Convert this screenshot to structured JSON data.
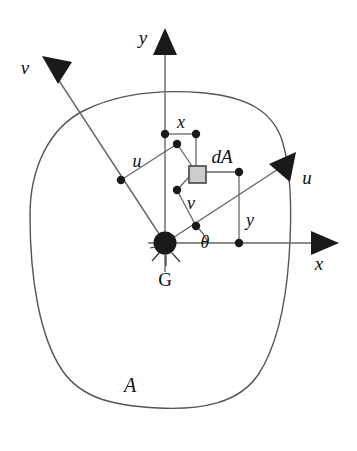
{
  "figure": {
    "background_color": "#ffffff",
    "outline_color": "#555555",
    "line_color": "#555555",
    "marker_color": "#111111",
    "element_fill_color": "#cccccc",
    "element_stroke_color": "#444444"
  },
  "labels": {
    "axis_y": "y",
    "axis_x": "x",
    "axis_u_right": "u",
    "axis_v_left": "v",
    "dim_x": "x",
    "dim_y": "y",
    "dim_u": "u",
    "dim_v": "v",
    "angle_theta": "θ",
    "element_dA": "dA",
    "area_A": "A",
    "centroid_G": "G"
  },
  "geometry": {
    "centroid": {
      "x": 165,
      "y": 243,
      "radius": 11
    },
    "axis_y": {
      "x": 165,
      "y_top": 44,
      "y_bottom": 270,
      "arrow_tip": [
        165,
        30
      ]
    },
    "axis_x": {
      "y": 243,
      "x_left": 150,
      "x_right": 322,
      "arrow_tip": [
        337,
        243
      ]
    },
    "axis_u": {
      "from": [
        165,
        243
      ],
      "to": [
        276,
        170
      ],
      "arrow_tip": [
        292,
        157
      ]
    },
    "axis_v": {
      "from": [
        165,
        243
      ],
      "to": [
        60,
        82
      ],
      "arrow_tip": [
        44,
        59
      ]
    },
    "element_dA": {
      "x": 189,
      "y": 166,
      "size": 17
    },
    "points": [
      {
        "name": "x-dim-left",
        "x": 165,
        "y": 134
      },
      {
        "name": "x-dim-right",
        "x": 196,
        "y": 134
      },
      {
        "name": "u-dim-upper",
        "x": 177,
        "y": 144
      },
      {
        "name": "u-dim-lower",
        "x": 121,
        "y": 180
      },
      {
        "name": "v-dim-lower",
        "x": 177,
        "y": 190
      },
      {
        "name": "v-dim-foot",
        "x": 196,
        "y": 226
      },
      {
        "name": "y-dim-top",
        "x": 239,
        "y": 172
      },
      {
        "name": "y-dim-bottom",
        "x": 239,
        "y": 243
      }
    ],
    "label_positions": {
      "axis_y": [
        143,
        38
      ],
      "axis_x": [
        319,
        265
      ],
      "axis_u_right": [
        305,
        180
      ],
      "axis_v_left": [
        22,
        68
      ],
      "dim_x": [
        181,
        126
      ],
      "dim_y": [
        249,
        222
      ],
      "dim_u": [
        136,
        163
      ],
      "dim_v": [
        190,
        205
      ],
      "angle_theta": [
        205,
        243
      ],
      "element_dA": [
        218,
        158
      ],
      "area_A": [
        128,
        385
      ],
      "centroid_G": [
        159,
        282
      ]
    }
  }
}
